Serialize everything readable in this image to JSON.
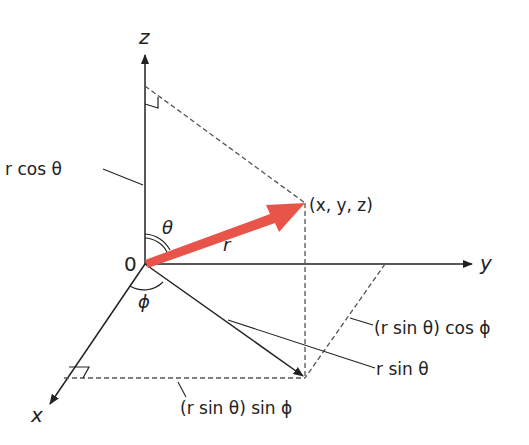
{
  "diagram": {
    "type": "spherical-coordinates",
    "colors": {
      "vector": "#e8534a",
      "line": "#222222",
      "dashed": "#555555",
      "background": "#ffffff"
    },
    "axes": {
      "x": "x",
      "y": "y",
      "z": "z"
    },
    "origin_label": "0",
    "point_label": "(x, y, z)",
    "vector_label": "r",
    "angles": {
      "polar": "θ",
      "azimuthal": "ϕ"
    },
    "annotations": {
      "z_projection": "r cos θ",
      "xy_projection": "r sin θ",
      "y_component": "(r sin θ) cos ϕ",
      "x_component": "(r sin θ) sin ϕ"
    }
  }
}
